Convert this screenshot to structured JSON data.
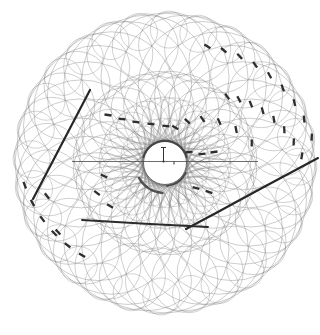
{
  "figure": {
    "background": "#ffffff",
    "canvas": {
      "width": 320,
      "height": 335
    },
    "center": {
      "x": 165,
      "y": 163
    },
    "inner_hole": {
      "radius": 21.5,
      "color": "#555555",
      "width": 0.9
    },
    "mesh": {
      "color": "#707070",
      "opacity": 0.5,
      "families": [
        {
          "count": 28,
          "ring": 86,
          "radius": 64,
          "phase": 0,
          "width": 0.7
        },
        {
          "count": 28,
          "ring": 57,
          "radius": 35,
          "phase": 6.4,
          "width": 0.65
        },
        {
          "count": 28,
          "ring": 118,
          "radius": 33,
          "phase": 3.2,
          "width": 0.65
        },
        {
          "count": 30,
          "ring": 44,
          "radius": 22,
          "phase": 5,
          "width": 0.55
        },
        {
          "count": 28,
          "ring": 133.5,
          "radius": 18.5,
          "phase": 1.6,
          "width": 0.6
        },
        {
          "count": 30,
          "ring": 33.5,
          "radius": 11.5,
          "phase": 2,
          "width": 0.5
        }
      ]
    },
    "axis_line": {
      "x1": 72,
      "y1": 161.5,
      "x2": 258,
      "y2": 161.5,
      "color": "#4a4a4a",
      "width": 0.8
    },
    "origin_marker": {
      "x": 163.5,
      "y": 161.5,
      "stem_height": 14,
      "cap_width": 5,
      "tick_x": 174,
      "tick_length": 3,
      "color": "#333333",
      "width": 1
    },
    "dark_arcs": [
      {
        "r": 22.5,
        "a0": 195,
        "a1": 345,
        "width": 2.0,
        "color": "#3a3a3a"
      },
      {
        "r": 23.0,
        "a0": 25,
        "a1": 85,
        "width": 1.8,
        "color": "#3a3a3a"
      },
      {
        "r": 30.0,
        "a0": 95,
        "a1": 150,
        "width": 2.5,
        "color": "#3a3a3a"
      }
    ],
    "tracks": [
      {
        "name": "track-left",
        "color": "#262626",
        "width": 2.2,
        "points": [
          [
            33,
            199
          ],
          [
            90,
            90
          ]
        ]
      },
      {
        "name": "track-right",
        "color": "#262626",
        "width": 2.1,
        "points": [
          [
            318,
            158
          ],
          [
            262,
            188
          ],
          [
            216,
            213
          ],
          [
            186,
            229
          ]
        ]
      },
      {
        "name": "track-bottom",
        "color": "#2b2b2b",
        "width": 1.9,
        "points": [
          [
            82,
            220
          ],
          [
            150,
            224
          ],
          [
            208,
            227
          ]
        ]
      }
    ],
    "hit_style": {
      "length": 7,
      "width": 2.3,
      "color": "#2e2e2e"
    },
    "hit_chains": [
      {
        "r0": 124,
        "a0": -70,
        "r1": 149,
        "a1": -10,
        "n": 9,
        "tilt": 12
      },
      {
        "r0": 91,
        "a0": -47,
        "r1": 137,
        "a1": -3,
        "n": 8,
        "tilt": 12
      },
      {
        "r0": 37,
        "a0": -74,
        "r1": 89,
        "a1": -13,
        "n": 6,
        "tilt": 14
      },
      {
        "r0": 142,
        "a0": 171,
        "r1": 124,
        "a1": 132,
        "n": 6,
        "tilt": -12
      }
    ],
    "hits": [
      [
        108,
        115,
        8
      ],
      [
        122,
        119,
        7
      ],
      [
        136,
        122,
        6
      ],
      [
        151,
        124,
        5
      ],
      [
        166,
        126,
        5
      ],
      [
        189,
        152,
        -7
      ],
      [
        202,
        154,
        -6
      ],
      [
        214,
        152,
        -8
      ],
      [
        196,
        188,
        15
      ],
      [
        209,
        192,
        18
      ],
      [
        104,
        176,
        28
      ],
      [
        97,
        193,
        38
      ],
      [
        110,
        206,
        30
      ],
      [
        47,
        196,
        52
      ],
      [
        58,
        232,
        48
      ]
    ]
  }
}
